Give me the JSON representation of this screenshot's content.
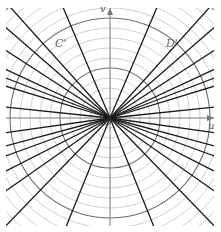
{
  "diagram": {
    "center": [
      110,
      118
    ],
    "circles": {
      "radius_step": 10,
      "count": 16,
      "major_every": 5,
      "minor_color": "#c8c8c8",
      "major_color": "#6e6e6e"
    },
    "axes": {
      "color": "#777777",
      "u_label": "u",
      "v_label": "v"
    },
    "rays": {
      "color": "#1a1a1a",
      "angles_deg": [
        67,
        48,
        41,
        33,
        25,
        21,
        17,
        6,
        -8,
        -15,
        -20,
        -27,
        -35,
        -46,
        -68,
        113,
        132,
        139,
        147,
        155,
        159,
        163,
        174,
        188,
        195,
        200,
        207,
        215,
        226,
        248
      ]
    },
    "labels": {
      "origin": "O",
      "curve_left": "C'",
      "curve_right": "D'"
    }
  }
}
